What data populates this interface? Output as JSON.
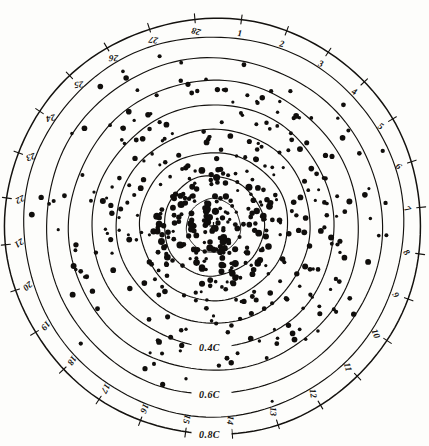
{
  "figure": {
    "title": "SCALE TIME OF MAXIMUM (DAYS)",
    "background_color": "#fdfdfb",
    "ink_color": "#14120f"
  },
  "chart_data": {
    "type": "scatter",
    "projection": "polar",
    "title": "SCALE TIME OF MAXIMUM (DAYS)",
    "xlabel": "Time of maximum (days, angular)",
    "ylabel": "Amplitude (C, radial)",
    "grid": true,
    "legend_position": "none",
    "angular_axis": {
      "label": "SCALE TIME OF MAXIMUM (DAYS)",
      "units": "days",
      "period": 28,
      "range": [
        1,
        28
      ],
      "tick_labels": [
        "1",
        "2",
        "3",
        "4",
        "5",
        "6",
        "7",
        "8",
        "9",
        "10",
        "11",
        "12",
        "13",
        "14",
        "15",
        "16",
        "17",
        "18",
        "19",
        "20",
        "21",
        "22",
        "23",
        "24",
        "25",
        "26",
        "27",
        "28"
      ]
    },
    "radial_axis": {
      "label": "C",
      "ring_count": 8,
      "labeled_rings": [
        {
          "label": "0.4C",
          "value": 0.4,
          "ring_index": 4
        },
        {
          "label": "0.6C",
          "value": 0.6,
          "ring_index": 6
        },
        {
          "label": "0.8C",
          "value": 0.8,
          "ring_index": 8
        }
      ],
      "range": [
        0,
        0.8
      ],
      "ring_values": [
        0.1,
        0.2,
        0.3,
        0.4,
        0.5,
        0.6,
        0.7,
        0.8
      ]
    },
    "series": [
      {
        "name": "observations",
        "marker": "filled-circle",
        "color": "#100e0c",
        "point_count": 372,
        "description": "Dense central cluster of observations thinning outward toward the 0.8C ring"
      }
    ],
    "annotations": [
      {
        "text": "0.4C",
        "kind": "ring-label"
      },
      {
        "text": "0.6C",
        "kind": "ring-label"
      },
      {
        "text": "0.8C",
        "kind": "ring-label"
      },
      {
        "text": "SCALE TIME OF MAXIMUM (DAYS)",
        "kind": "curved-title"
      }
    ]
  }
}
